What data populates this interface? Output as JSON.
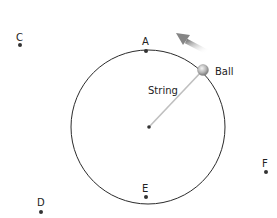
{
  "diagram": {
    "labels": {
      "ball": "Ball",
      "string": "String"
    },
    "points": [
      {
        "id": "A",
        "label": "A",
        "x": 146,
        "y": 51
      },
      {
        "id": "C",
        "label": "C",
        "x": 20,
        "y": 45
      },
      {
        "id": "D",
        "label": "D",
        "x": 41,
        "y": 212
      },
      {
        "id": "E",
        "label": "E",
        "x": 146,
        "y": 197
      },
      {
        "id": "F",
        "label": "F",
        "x": 266,
        "y": 172
      }
    ],
    "circle": {
      "cx": 148,
      "cy": 127,
      "r": 77,
      "stroke": "#2b2b2b"
    },
    "center": {
      "x": 149,
      "y": 127
    },
    "ball": {
      "x": 203,
      "y": 70,
      "color": "#b8b8b8"
    },
    "string_color": "#bfbfbf",
    "arrow_color": "#8a8a8a"
  }
}
